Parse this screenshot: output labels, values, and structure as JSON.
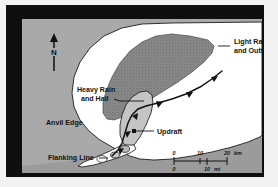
{
  "figure": {
    "kind": "plan-view-diagram",
    "frame_color": "#100f0f",
    "page_color": "#f2f2f2"
  },
  "map": {
    "background_color": "#a9a9a9",
    "anvil_fill": "#ffffff",
    "heavy_precip_fill": "#8a8a8a",
    "updraft_fill": "#c4c4c4",
    "ink_color": "#14120f"
  },
  "compass": {
    "label": "N",
    "arrow_icon": "north-arrow-icon"
  },
  "labels": [
    {
      "id": "light-rain",
      "text_line_1": "Light Rain",
      "text_line_2": "and Outflow"
    },
    {
      "id": "heavy-rain",
      "text_line_1": "Heavy Rain",
      "text_line_2": "and Hail"
    },
    {
      "id": "anvil-edge",
      "text_line_1": "Anvil Edge"
    },
    {
      "id": "updraft",
      "text_line_1": "Updraft"
    },
    {
      "id": "flanking-line",
      "text_line_1": "Flanking Line"
    }
  ],
  "scale_bar": {
    "km": {
      "ticks": [
        "0",
        "10",
        "20"
      ],
      "unit": "km"
    },
    "mi": {
      "ticks": [
        "0",
        "10"
      ],
      "unit": "mi"
    }
  }
}
